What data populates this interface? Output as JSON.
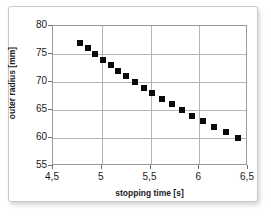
{
  "chart_data": {
    "type": "scatter",
    "title": "",
    "xlabel": "stopping time [s]",
    "ylabel": "outer radius [mm]",
    "xlim": [
      4.5,
      6.5
    ],
    "ylim": [
      55,
      80
    ],
    "xticks": [
      "4,5",
      "5",
      "5,5",
      "6",
      "6,5"
    ],
    "xtick_values": [
      4.5,
      5.0,
      5.5,
      6.0,
      6.5
    ],
    "yticks": [
      "55",
      "60",
      "65",
      "70",
      "75",
      "80"
    ],
    "ytick_values": [
      55,
      60,
      65,
      70,
      75,
      80
    ],
    "grid": true,
    "legend": null,
    "marker": "filled-square",
    "marker_color": "#0a0a0a",
    "series": [
      {
        "name": "outer radius vs stopping time",
        "x": [
          4.78,
          4.86,
          4.93,
          5.01,
          5.09,
          5.17,
          5.25,
          5.34,
          5.43,
          5.52,
          5.62,
          5.72,
          5.82,
          5.93,
          6.04,
          6.15,
          6.27,
          6.4
        ],
        "y": [
          77,
          76,
          75,
          74,
          73,
          72,
          71,
          70,
          69,
          68,
          67,
          66,
          65,
          64,
          63,
          62,
          61,
          60
        ]
      }
    ]
  },
  "style": {
    "plot_background": "#ffffff",
    "grid_color": "#b4b4b4",
    "frame_color": "#9a9a9a",
    "marker_color": "#0a0a0a",
    "text_color": "#1a1a1a",
    "figure_border_color": "#c8c8c8"
  }
}
